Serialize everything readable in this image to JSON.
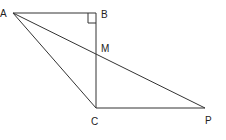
{
  "diagram": {
    "points": {
      "A": {
        "label": "A"
      },
      "B": {
        "label": "B"
      },
      "M": {
        "label": "M"
      },
      "C": {
        "label": "C"
      },
      "P": {
        "label": "P"
      }
    },
    "segments": [
      "AB",
      "BC",
      "AC",
      "AP",
      "CP"
    ],
    "right_angle_at": "B"
  }
}
